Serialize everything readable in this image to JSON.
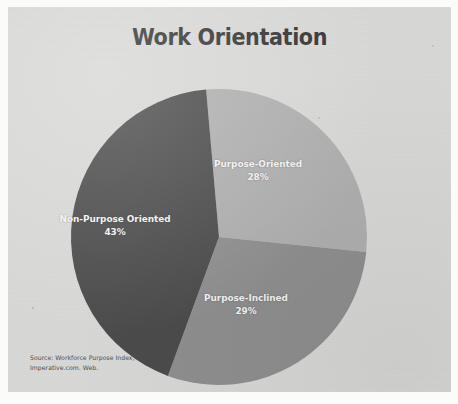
{
  "chart_data": {
    "type": "pie",
    "title": "Work Orientation",
    "categories": [
      "Purpose-Oriented",
      "Purpose-Inclined",
      "Non-Purpose Oriented"
    ],
    "values": [
      28,
      29,
      43
    ],
    "value_unit": "%",
    "labels": [
      "28%",
      "29%",
      "43%"
    ],
    "colors": [
      "#aeaeae",
      "#8e8e8e",
      "#4b4b4b"
    ],
    "start_angle_deg": -5,
    "direction": "clockwise",
    "legend": "none",
    "labels_position": "inside-slice",
    "grid": false,
    "xlabel": "",
    "ylabel": "",
    "source": "Source: Workforce Purpose Index, Imperative.com. Web."
  },
  "title": "Work Orientation",
  "slices": [
    {
      "name": "Purpose-Oriented",
      "label": "Purpose-Oriented",
      "percent_label": "28%",
      "value": 28,
      "color": "#aeaeae"
    },
    {
      "name": "Purpose-Inclined",
      "label": "Purpose-Inclined",
      "percent_label": "29%",
      "value": 29,
      "color": "#8e8e8e"
    },
    {
      "name": "Non-Purpose Oriented",
      "label": "Non-Purpose Oriented",
      "percent_label": "43%",
      "value": 43,
      "color": "#4b4b4b"
    }
  ],
  "source": {
    "line1": "Source: Workforce Purpose Index,",
    "line2": "Imperative.com. Web."
  },
  "theme": {
    "page_background": "#d7d7d5",
    "scan_background": "#fbfbfa",
    "title_color": "#353535",
    "label_color": "#f2f2f2",
    "source_color": "#4d4d4d"
  }
}
